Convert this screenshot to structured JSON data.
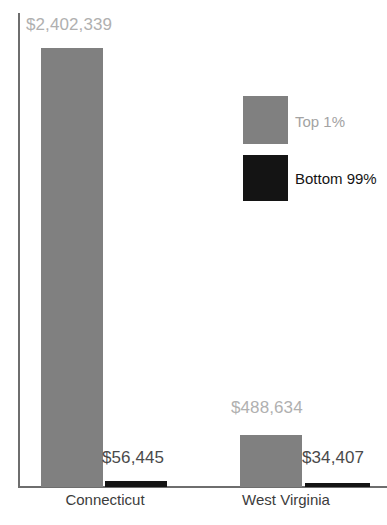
{
  "chart_data": {
    "type": "bar",
    "title": "",
    "subtitle": "",
    "xlabel": "",
    "ylabel": "",
    "grid": false,
    "legend_position": "inside-right-top",
    "categories": [
      "Connecticut",
      "West Virginia"
    ],
    "series": [
      {
        "name": "Top 1%",
        "color": "#808080",
        "values": [
          2402339,
          1488634
        ],
        "value_labels": [
          "$2,402,339",
          "$488,634"
        ]
      },
      {
        "name": "Bottom 99%",
        "color": "#141414",
        "values": [
          56445,
          34407
        ],
        "value_labels": [
          "$56,445",
          "$34,407"
        ]
      }
    ],
    "ylim": [
      0,
      2402339
    ],
    "axis_color": "#6e6e6e"
  },
  "bars": {
    "ct_top": {
      "label": "$2,402,339",
      "value": 2402339,
      "series": "Top 1%",
      "category": "Connecticut"
    },
    "ct_bottom": {
      "label": "$56,445",
      "value": 56445,
      "series": "Bottom 99%",
      "category": "Connecticut"
    },
    "wv_top": {
      "label": "$488,634",
      "value": 488634,
      "series": "Top 1%",
      "category": "West Virginia"
    },
    "wv_bottom": {
      "label": "$34,407",
      "value": 34407,
      "series": "Bottom 99%",
      "category": "West Virginia"
    }
  },
  "categories": {
    "connecticut": "Connecticut",
    "west_virginia": "West Virginia"
  },
  "legend": {
    "items": [
      {
        "label": "Top 1%",
        "color": "#808080"
      },
      {
        "label": "Bottom 99%",
        "color": "#141414"
      }
    ]
  },
  "colors": {
    "top_series": "#808080",
    "bottom_series": "#141414",
    "light_label": "#b0b0b0",
    "dark_label": "#4a4a4a",
    "axis": "#6e6e6e",
    "background": "#ffffff"
  }
}
